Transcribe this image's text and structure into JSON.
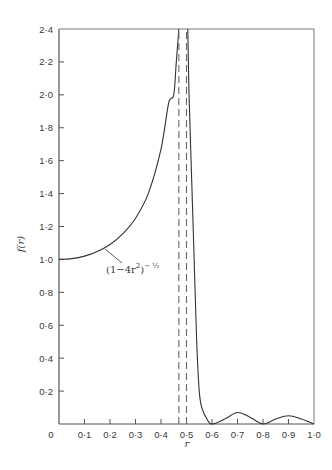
{
  "chart_data": {
    "type": "line",
    "title": "",
    "xlabel": "r",
    "ylabel": "f(r)",
    "xlim": [
      0,
      1.0
    ],
    "ylim": [
      0,
      2.4
    ],
    "grid": false,
    "legend": null,
    "x_ticks": [
      "0",
      "0·1",
      "0·2",
      "0·3",
      "0·4",
      "0·5",
      "0·6",
      "0·7",
      "0·8",
      "0·9",
      "1·0"
    ],
    "y_ticks": [
      "0·2",
      "0·4",
      "0·6",
      "0·8",
      "1·0",
      "1·2",
      "1·4",
      "1·6",
      "1·8",
      "2·0",
      "2·2",
      "2·4"
    ],
    "annotations": [
      {
        "text": "(1−4r²)^(−1/2)",
        "base": "(1−4r",
        "sup1": "2",
        "close": ")",
        "sup2": "− ½",
        "points_to": {
          "r": 0.18,
          "f": 1.08
        }
      }
    ],
    "series": [
      {
        "name": "f(r) solid curve (left branch, (1-4r²)^-1/2)",
        "style": "solid",
        "x": [
          0.0,
          0.05,
          0.1,
          0.15,
          0.2,
          0.25,
          0.3,
          0.35,
          0.4,
          0.43,
          0.45,
          0.46,
          0.47
        ],
        "y": [
          1.0,
          1.005,
          1.02,
          1.048,
          1.091,
          1.155,
          1.25,
          1.4,
          1.67,
          1.95,
          2.0,
          2.2,
          2.4
        ]
      },
      {
        "name": "f(r) solid curve (right branch, falling)",
        "style": "solid",
        "x": [
          0.505,
          0.51,
          0.52,
          0.53,
          0.54,
          0.55,
          0.56,
          0.58,
          0.6,
          0.65,
          0.7,
          0.75,
          0.8,
          0.85,
          0.9,
          0.95,
          1.0
        ],
        "y": [
          2.4,
          2.0,
          1.5,
          1.0,
          0.5,
          0.2,
          0.1,
          0.03,
          0.0,
          0.03,
          0.07,
          0.04,
          0.0,
          0.03,
          0.05,
          0.03,
          0.0
        ]
      },
      {
        "name": "dashed asymptote 1",
        "style": "dashed",
        "x": [
          0.47,
          0.47
        ],
        "y": [
          0,
          2.4
        ]
      },
      {
        "name": "dashed asymptote 2",
        "style": "dashed",
        "x": [
          0.5,
          0.5
        ],
        "y": [
          0,
          2.4
        ]
      }
    ]
  }
}
